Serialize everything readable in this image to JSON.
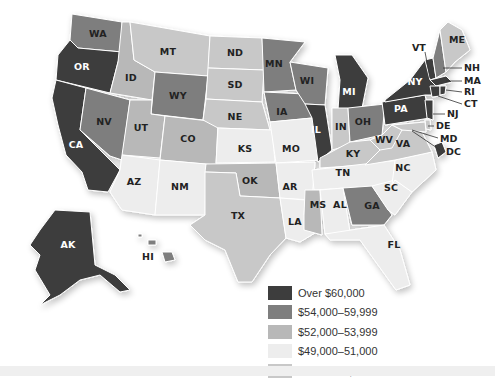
{
  "map": {
    "title": "",
    "type": "choropleth",
    "region": "United States",
    "colors": {
      "over_60000": "#3d3d3d",
      "54000_59999": "#7e7e7e",
      "52000_53999": "#b8b8b8",
      "49000_51000": "#ededed",
      "under_49000": "#c8c8c8"
    }
  },
  "legend": {
    "items": [
      {
        "key": "over_60000",
        "label": "Over $60,000",
        "color": "#3d3d3d"
      },
      {
        "key": "54000_59999",
        "label": "$54,000–59,999",
        "color": "#7e7e7e"
      },
      {
        "key": "52000_53999",
        "label": "$52,000–53,999",
        "color": "#b8b8b8"
      },
      {
        "key": "49000_51000",
        "label": "$49,000–51,000",
        "color": "#ededed"
      },
      {
        "key": "under_49000",
        "label": "Under $49,000",
        "color": "#c8c8c8"
      }
    ]
  },
  "states": {
    "WA": {
      "label": "WA",
      "category": "54000_59999"
    },
    "OR": {
      "label": "OR",
      "category": "over_60000"
    },
    "CA": {
      "label": "CA",
      "category": "over_60000"
    },
    "NV": {
      "label": "NV",
      "category": "54000_59999"
    },
    "ID": {
      "label": "ID",
      "category": "52000_53999"
    },
    "MT": {
      "label": "MT",
      "category": "under_49000"
    },
    "WY": {
      "label": "WY",
      "category": "54000_59999"
    },
    "UT": {
      "label": "UT",
      "category": "52000_53999"
    },
    "CO": {
      "label": "CO",
      "category": "52000_53999"
    },
    "AZ": {
      "label": "AZ",
      "category": "49000_51000"
    },
    "NM": {
      "label": "NM",
      "category": "49000_51000"
    },
    "ND": {
      "label": "ND",
      "category": "under_49000"
    },
    "SD": {
      "label": "SD",
      "category": "under_49000"
    },
    "NE": {
      "label": "NE",
      "category": "under_49000"
    },
    "KS": {
      "label": "KS",
      "category": "49000_51000"
    },
    "OK": {
      "label": "OK",
      "category": "52000_53999"
    },
    "TX": {
      "label": "TX",
      "category": "under_49000"
    },
    "MN": {
      "label": "MN",
      "category": "54000_59999"
    },
    "IA": {
      "label": "IA",
      "category": "54000_59999"
    },
    "MO": {
      "label": "MO",
      "category": "49000_51000"
    },
    "AR": {
      "label": "AR",
      "category": "49000_51000"
    },
    "LA": {
      "label": "LA",
      "category": "49000_51000"
    },
    "WI": {
      "label": "WI",
      "category": "54000_59999"
    },
    "IL": {
      "label": "IL",
      "category": "over_60000"
    },
    "MI": {
      "label": "MI",
      "category": "over_60000"
    },
    "IN": {
      "label": "IN",
      "category": "under_49000"
    },
    "OH": {
      "label": "OH",
      "category": "54000_59999"
    },
    "KY": {
      "label": "KY",
      "category": "under_49000"
    },
    "TN": {
      "label": "TN",
      "category": "49000_51000"
    },
    "MS": {
      "label": "MS",
      "category": "52000_53999"
    },
    "AL": {
      "label": "AL",
      "category": "49000_51000"
    },
    "GA": {
      "label": "GA",
      "category": "54000_59999"
    },
    "FL": {
      "label": "FL",
      "category": "49000_51000"
    },
    "SC": {
      "label": "SC",
      "category": "49000_51000"
    },
    "NC": {
      "label": "NC",
      "category": "49000_51000"
    },
    "VA": {
      "label": "VA",
      "category": "under_49000"
    },
    "WV": {
      "label": "WV",
      "category": "under_49000"
    },
    "PA": {
      "label": "PA",
      "category": "over_60000"
    },
    "NY": {
      "label": "NY",
      "category": "over_60000"
    },
    "VT": {
      "label": "VT",
      "category": "over_60000"
    },
    "NH": {
      "label": "NH",
      "category": "54000_59999"
    },
    "ME": {
      "label": "ME",
      "category": "under_49000"
    },
    "MA": {
      "label": "MA",
      "category": "over_60000"
    },
    "RI": {
      "label": "RI",
      "category": "over_60000"
    },
    "CT": {
      "label": "CT",
      "category": "over_60000"
    },
    "NJ": {
      "label": "NJ",
      "category": "over_60000"
    },
    "DE": {
      "label": "DE",
      "category": "under_49000"
    },
    "MD": {
      "label": "MD",
      "category": "under_49000"
    },
    "DC": {
      "label": "DC",
      "category": "over_60000"
    },
    "AK": {
      "label": "AK",
      "category": "over_60000"
    },
    "HI": {
      "label": "HI",
      "category": "54000_59999"
    }
  }
}
